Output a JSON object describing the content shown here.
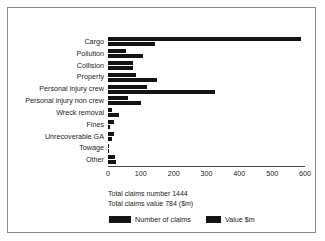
{
  "chart_data": {
    "type": "bar",
    "orientation": "horizontal",
    "title": "",
    "xlabel": "",
    "ylabel": "",
    "xlim": [
      0,
      600
    ],
    "xticks": [
      0,
      100,
      200,
      300,
      400,
      500,
      600
    ],
    "grid": false,
    "legend_position": "bottom",
    "categories": [
      "Cargo",
      "Pollution",
      "Collision",
      "Property",
      "Personal injury crew",
      "Personal injury non crew",
      "Wreck removal",
      "Fines",
      "Unrecoverable GA",
      "Towage",
      "Other"
    ],
    "series": [
      {
        "name": "Number of claims",
        "color": "#141414",
        "values": [
          588,
          55,
          75,
          85,
          120,
          60,
          12,
          18,
          18,
          4,
          22
        ]
      },
      {
        "name": "Value $m",
        "color": "#141414",
        "values": [
          142,
          107,
          75,
          150,
          325,
          100,
          33,
          5,
          12,
          2,
          25
        ]
      }
    ]
  },
  "annotations": {
    "total_claims_number": "Total claims number 1444",
    "total_claims_value": "Total claims value 784 ($m)"
  },
  "legend": {
    "items": [
      {
        "label": "Number of claims",
        "color": "#141414"
      },
      {
        "label": "Value $m",
        "color": "#141414"
      }
    ]
  },
  "colors": {
    "bar": "#141414",
    "axis": "#4a4a4a",
    "frame": "#8a8a8a",
    "text": "#1d1d1d",
    "background": "#ffffff"
  }
}
